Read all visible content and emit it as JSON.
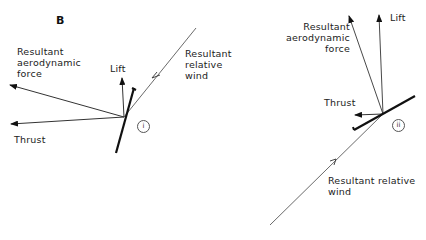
{
  "diagrams": [
    {
      "id": "B",
      "label": "B",
      "marker": "i",
      "labels": {
        "resultant_aero": "Resultant\naerodynamic\nforce",
        "lift": "Lift",
        "thrust": "Thrust",
        "relative_wind": "Resultant\nrelative\nwind"
      }
    },
    {
      "id": "ii",
      "marker": "ii",
      "labels": {
        "resultant_aero": "Resultant\naerodynamic\nforce",
        "lift": "Lift",
        "thrust": "Thrust",
        "relative_wind": "Resultant relative\nwind"
      }
    }
  ],
  "colors": {
    "line": "#222222",
    "text": "#222222",
    "background": "#ffffff"
  }
}
